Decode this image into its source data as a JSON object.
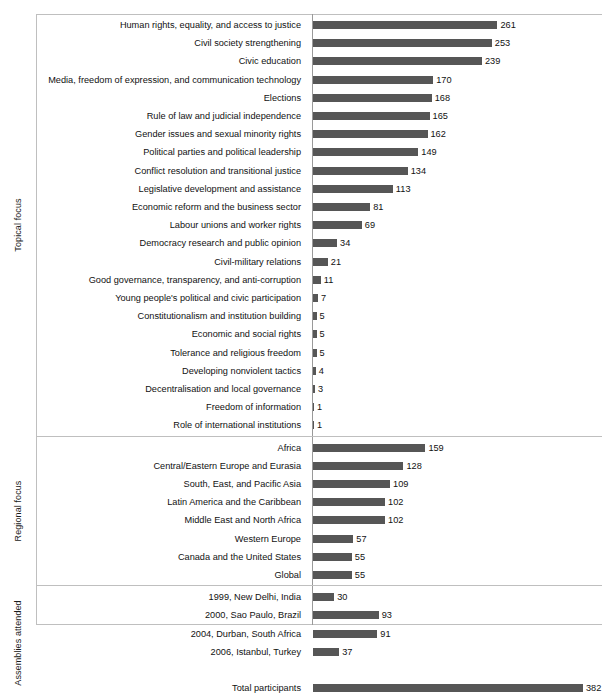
{
  "chart_data": {
    "type": "bar",
    "orientation": "horizontal",
    "title": "",
    "xlabel": "",
    "ylabel": "",
    "xlim": [
      0,
      382
    ],
    "grid": false,
    "legend": null,
    "bar_color": "#565656",
    "axis_color": "#9a9a9a",
    "frame_color": "#bfbfbf",
    "groups": [
      {
        "label": "Topical focus",
        "categories": [
          "Human rights, equality, and access to justice",
          "Civil society strengthening",
          "Civic education",
          "Media, freedom of expression, and communication technology",
          "Elections",
          "Rule of law and judicial independence",
          "Gender issues and sexual minority rights",
          "Political parties and political leadership",
          "Conflict resolution and transitional justice",
          "Legislative development and assistance",
          "Economic reform and the business sector",
          "Labour unions and worker rights",
          "Democracy research and public opinion",
          "Civil-military relations",
          "Good governance, transparency, and anti-corruption",
          "Young people's political and civic participation",
          "Constitutionalism and institution building",
          "Economic and social rights",
          "Tolerance and religious freedom",
          "Developing nonviolent tactics",
          "Decentralisation and local governance",
          "Freedom of information",
          "Role of international institutions"
        ],
        "values": [
          261,
          253,
          239,
          170,
          168,
          165,
          162,
          149,
          134,
          113,
          81,
          69,
          34,
          21,
          11,
          7,
          5,
          5,
          5,
          4,
          3,
          1,
          1
        ]
      },
      {
        "label": "Regional focus",
        "categories": [
          "Africa",
          "Central/Eastern Europe and Eurasia",
          "South, East, and Pacific Asia",
          "Latin America and the Caribbean",
          "Middle East and North Africa",
          "Western Europe",
          "Canada and the United States",
          "Global"
        ],
        "values": [
          159,
          128,
          109,
          102,
          102,
          57,
          55,
          55
        ]
      },
      {
        "label": "Assemblies attended",
        "categories": [
          "1999, New Delhi, India",
          "2000, Sao Paulo, Brazil",
          "2004, Durban, South Africa",
          "2006, Istanbul, Turkey",
          "",
          "Total participants"
        ],
        "values": [
          30,
          93,
          91,
          37,
          null,
          382
        ]
      }
    ]
  }
}
